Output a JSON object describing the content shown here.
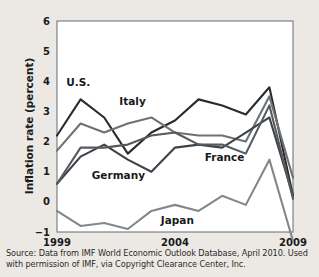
{
  "figure": {
    "name": "inflation-rate-line-chart",
    "background_color": "#ece9e4",
    "plot_background_color": "#ffffff"
  },
  "source": {
    "line1": "Source: Data from IMF World Economic Outlook Database, April 2010. Used",
    "line2": "with permission of IMF, via Copyright Clearance Center, Inc."
  },
  "chart_data": {
    "type": "line",
    "title": "",
    "xlabel": "",
    "ylabel": "Inflation rate (percent)",
    "xlim": [
      1999,
      2009
    ],
    "ylim": [
      -1,
      6
    ],
    "grid": true,
    "legend": "inline-labels",
    "xticks": [
      1999,
      2004,
      2009
    ],
    "xtick_labels": [
      "1999",
      "2004",
      "2009"
    ],
    "yticks": [
      -1,
      0,
      1,
      2,
      3,
      4,
      5,
      6
    ],
    "ytick_labels": [
      "−1",
      "0",
      "1",
      "2",
      "3",
      "4",
      "5",
      "6"
    ],
    "x": [
      1999,
      2000,
      2001,
      2002,
      2003,
      2004,
      2005,
      2006,
      2007,
      2008,
      2009
    ],
    "series": [
      {
        "name": "U.S.",
        "label": "U.S.",
        "color": "#2b2b2b",
        "label_x": 1999.9,
        "label_y": 3.85,
        "values": [
          2.2,
          3.4,
          2.8,
          1.6,
          2.3,
          2.7,
          3.4,
          3.2,
          2.9,
          3.8,
          0.2
        ]
      },
      {
        "name": "Italy",
        "label": "Italy",
        "color": "#6e7175",
        "label_x": 2002.2,
        "label_y": 3.2,
        "values": [
          1.7,
          2.6,
          2.3,
          2.6,
          2.8,
          2.3,
          2.2,
          2.2,
          2.0,
          3.5,
          0.8
        ]
      },
      {
        "name": "Germany",
        "label": "Germany",
        "color": "#3f4246",
        "label_x": 2001.6,
        "label_y": 0.75,
        "values": [
          0.6,
          1.5,
          1.9,
          1.4,
          1.0,
          1.8,
          1.9,
          1.8,
          2.3,
          2.8,
          0.2
        ]
      },
      {
        "name": "France",
        "label": "France",
        "color": "#555a5e",
        "label_x": 2006.1,
        "label_y": 1.35,
        "values": [
          0.6,
          1.8,
          1.8,
          1.9,
          2.2,
          2.3,
          1.9,
          1.9,
          1.6,
          3.2,
          0.1
        ]
      },
      {
        "name": "Japan",
        "label": "Japan",
        "color": "#83878b",
        "label_x": 2004.1,
        "label_y": -0.72,
        "values": [
          -0.3,
          -0.8,
          -0.7,
          -0.9,
          -0.3,
          -0.1,
          -0.3,
          0.2,
          -0.1,
          1.4,
          -1.3
        ]
      }
    ]
  }
}
